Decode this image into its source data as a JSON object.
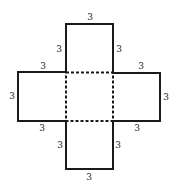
{
  "diagram": {
    "colors": {
      "solid_line": "#1a1a1a",
      "dashed_line": "#1a1a1a",
      "label": "#222222",
      "background": "#ffffff"
    },
    "labels": {
      "top_top": "3",
      "top_left": "3",
      "top_right": "3",
      "left_top": "3",
      "left_left": "3",
      "left_bottom": "3",
      "right_top": "3",
      "right_right": "3",
      "right_bottom": "3",
      "bottom_left": "3",
      "bottom_right": "3",
      "bottom_bottom": "3"
    }
  }
}
